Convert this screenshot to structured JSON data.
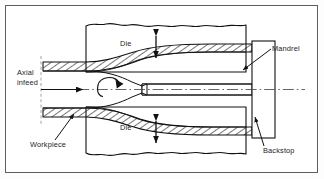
{
  "figure": {
    "background_color": "#ffffff",
    "border_color": "#5e5e5e",
    "line_color": "#111111",
    "hatch_color": "#111111"
  },
  "labels": {
    "die_top": "Die",
    "die_bottom": "Die",
    "mandrel": "Mandrel",
    "backstop": "Backstop",
    "workpiece": "Workpiece",
    "axial_line1": "Axial",
    "axial_line2": "infeed"
  },
  "annotations": {
    "die_top_arrow": "vertical-double-arrow",
    "die_bottom_arrow": "vertical-double-arrow",
    "mandrel_leader": "leader-arrow-down-left",
    "backstop_leader": "leader-arrow-up-left",
    "workpiece_leader": "leader-arrow-up-right",
    "axial_feed_arrow": "horizontal-arrow-right",
    "rotation_arrow": "curved-rotation-arrow",
    "centerline": "dash-dot-axis"
  },
  "parts": {
    "upper_die": "upper die block with wavy break edge",
    "lower_die": "lower die block with wavy break edge",
    "workpiece_wall": "hatched tube wall, thick at inlet thinning over mandrel",
    "mandrel_body": "unhatched central cylinder",
    "backstop_block": "rectangular block at right end of mandrel"
  }
}
